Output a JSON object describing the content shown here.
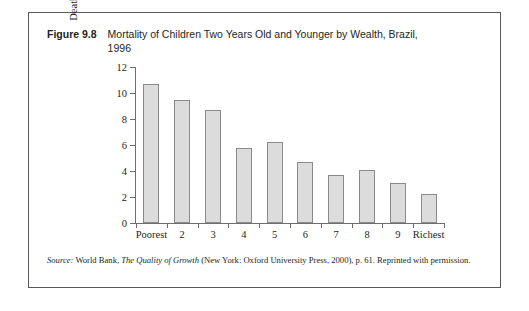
{
  "figure": {
    "number": "Figure 9.8",
    "title": "Mortality of Children Two Years Old and Younger by Wealth, Brazil, 1996"
  },
  "source": {
    "label": "Source:",
    "text_before_italic": " World Bank, ",
    "italic_title": "The Quality of Growth",
    "text_after_italic": " (New York: Oxford University Press, 2000), p. 61. Reprinted with permission."
  },
  "colors": {
    "bar_fill": "#dcdcdc",
    "bar_border": "#8a8a8a",
    "axis": "#6d6e71",
    "frame": "#58595b",
    "text": "#231f20"
  },
  "chart_data": {
    "type": "bar",
    "title": "Mortality of Children Two Years Old and Younger by Wealth, Brazil, 1996",
    "xlabel": "",
    "ylabel": "Deaths per 1,000",
    "categories": [
      "Poorest",
      "2",
      "3",
      "4",
      "5",
      "6",
      "7",
      "8",
      "9",
      "Richest"
    ],
    "values": [
      10.7,
      9.5,
      8.7,
      5.8,
      6.2,
      4.7,
      3.7,
      4.1,
      3.1,
      2.2
    ],
    "ylim": [
      0,
      12
    ],
    "yticks": [
      0,
      2,
      4,
      6,
      8,
      10,
      12
    ],
    "ytick_labels": [
      "0",
      "2",
      "4",
      "6",
      "8",
      "10",
      "12"
    ],
    "grid": false,
    "legend": false
  }
}
